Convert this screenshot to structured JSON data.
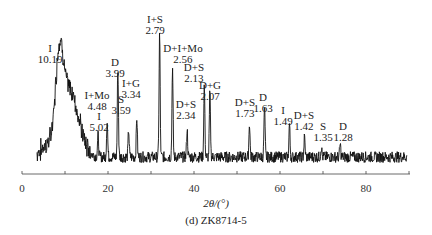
{
  "chart_data": {
    "type": "line",
    "title": "",
    "caption": "(d) ZK8714-5",
    "xlabel": "2θ/(°)",
    "ylabel": "",
    "xlim": [
      0,
      90
    ],
    "x_ticks": [
      0,
      20,
      40,
      60,
      80
    ],
    "x_tick_labels": [
      "0",
      "20",
      "40",
      "60",
      "80"
    ],
    "minor_ticks": [
      10,
      30,
      50,
      70,
      90
    ],
    "grid": false,
    "legend": null,
    "peaks": [
      {
        "label": "I",
        "d": "10.19",
        "two_theta": 8.7,
        "height": 0.62
      },
      {
        "label": "I",
        "d": "5.02",
        "two_theta": 17.7,
        "height": 0.18
      },
      {
        "label": "I+Mo",
        "d": "4.48",
        "two_theta": 19.8,
        "height": 0.3
      },
      {
        "label": "D",
        "d": "3.99",
        "two_theta": 22.3,
        "height": 0.72
      },
      {
        "label": "S",
        "d": "3.59",
        "two_theta": 24.8,
        "height": 0.22
      },
      {
        "label": "I+G",
        "d": "3.34",
        "two_theta": 26.7,
        "height": 0.32
      },
      {
        "label": "I+S",
        "d": "2.79",
        "two_theta": 32.0,
        "height": 1.0
      },
      {
        "label": "D+I+Mo",
        "d": "2.56",
        "two_theta": 35.0,
        "height": 0.72
      },
      {
        "label": "D+S",
        "d": "2.34",
        "two_theta": 38.4,
        "height": 0.22
      },
      {
        "label": "D+S",
        "d": "2.13",
        "two_theta": 42.4,
        "height": 0.58
      },
      {
        "label": "D+G",
        "d": "2.07",
        "two_theta": 43.7,
        "height": 0.52
      },
      {
        "label": "D+S",
        "d": "1.73",
        "two_theta": 52.9,
        "height": 0.28
      },
      {
        "label": "D",
        "d": "1.63",
        "two_theta": 56.4,
        "height": 0.4
      },
      {
        "label": "I",
        "d": "1.49",
        "two_theta": 62.2,
        "height": 0.27
      },
      {
        "label": "D+S",
        "d": "1.42",
        "two_theta": 65.7,
        "height": 0.16
      },
      {
        "label": "S",
        "d": "1.35",
        "two_theta": 69.6,
        "height": 0.08
      },
      {
        "label": "D",
        "d": "1.28",
        "two_theta": 74.0,
        "height": 0.1
      }
    ]
  },
  "annotations": [
    {
      "name": "I",
      "d": "10.19",
      "x": 50,
      "y": 43
    },
    {
      "name": "I+Mo",
      "d": "4.48",
      "x": 97,
      "y": 90
    },
    {
      "name": "I",
      "d": "5.02",
      "x": 99,
      "y": 111
    },
    {
      "name": "D",
      "d": "3.99",
      "x": 115,
      "y": 57
    },
    {
      "name": "S",
      "d": "3.59",
      "x": 121,
      "y": 94
    },
    {
      "name": "I+G",
      "d": "3.34",
      "x": 131,
      "y": 78
    },
    {
      "name": "I+S",
      "d": "2.79",
      "x": 155,
      "y": 14
    },
    {
      "name": "D+I+Mo",
      "d": "2.56",
      "x": 183,
      "y": 43
    },
    {
      "name": "D+S",
      "d": "2.13",
      "x": 194,
      "y": 62
    },
    {
      "name": "D+G",
      "d": "2.07",
      "x": 210,
      "y": 80
    },
    {
      "name": "D+S",
      "d": "2.34",
      "x": 186,
      "y": 99
    },
    {
      "name": "D+S",
      "d": "1.73",
      "x": 245,
      "y": 97
    },
    {
      "name": "D",
      "d": "1.63",
      "x": 263,
      "y": 92
    },
    {
      "name": "I",
      "d": "1.49",
      "x": 283,
      "y": 105
    },
    {
      "name": "D+S",
      "d": "1.42",
      "x": 304,
      "y": 110
    },
    {
      "name": "S",
      "d": "1.35",
      "x": 323,
      "y": 121
    },
    {
      "name": "D",
      "d": "1.28",
      "x": 343,
      "y": 121
    }
  ]
}
